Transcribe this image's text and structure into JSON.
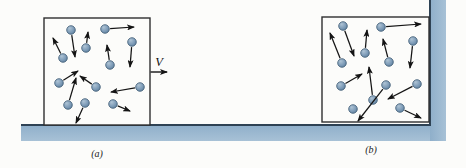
{
  "figure": {
    "description_hint": "two boxes of gas molecules with random velocity vectors; left box also moves with bulk velocity V; blue floor and right wall",
    "colors": {
      "background": "#fcfcfa",
      "wall_fill": "#8fafca",
      "wall_fill_light": "#a7c1d6",
      "wall_edge": "#2e4254",
      "box_border": "#2f2f2f",
      "particle_hi": "#aec3d4",
      "particle_fill": "#7e9cb8",
      "particle_dark": "#587a97",
      "particle_stroke": "#3d5a74",
      "arrow": "#141414",
      "label": "#222222"
    },
    "floor": {
      "x": 21,
      "y": 125,
      "w": 425,
      "h": 16
    },
    "wall": {
      "x": 430,
      "y": 0,
      "w": 16,
      "h": 141
    },
    "wall_edge_path": "M 21 125 L 430 125 L 430 0",
    "particle_radius": 4.3,
    "panels": [
      {
        "id": "a",
        "label": "(a)",
        "label_pos": {
          "x": 97,
          "y": 157
        },
        "box": {
          "x": 44,
          "y": 18,
          "w": 106,
          "h": 107
        },
        "velocity": {
          "label": "V",
          "x1": 150.5,
          "y1": 72,
          "x2": 167,
          "y2": 72,
          "label_x": 159,
          "label_y": 66
        },
        "particles": [
          [
            71,
            30,
            75,
            57
          ],
          [
            105,
            29,
            134,
            27
          ],
          [
            86,
            48,
            88,
            32
          ],
          [
            132,
            42,
            130,
            67
          ],
          [
            63,
            58,
            53,
            38
          ],
          [
            110,
            65,
            107,
            45
          ],
          [
            59,
            83,
            78,
            71
          ],
          [
            96,
            87,
            80,
            76
          ],
          [
            140,
            87,
            111,
            92
          ],
          [
            68,
            105,
            76,
            78
          ],
          [
            85,
            103,
            76,
            123
          ],
          [
            113,
            104,
            130,
            111
          ]
        ]
      },
      {
        "id": "b",
        "label": "(b)",
        "label_pos": {
          "x": 371,
          "y": 153
        },
        "velocity": null,
        "box": {
          "x": 322,
          "y": 17,
          "w": 107,
          "h": 105
        },
        "particles": [
          [
            343,
            26,
            354,
            56
          ],
          [
            381,
            27,
            421,
            24
          ],
          [
            413,
            41,
            410,
            68
          ],
          [
            365,
            53,
            367,
            30
          ],
          [
            342,
            63,
            330,
            33
          ],
          [
            389,
            62,
            383,
            39
          ],
          [
            341,
            86,
            362,
            74
          ],
          [
            386,
            85,
            358,
            121
          ],
          [
            373,
            100,
            369,
            67
          ],
          [
            417,
            84,
            388,
            99
          ],
          [
            353,
            109,
            null,
            null
          ],
          [
            400,
            108,
            421,
            118
          ]
        ]
      }
    ]
  }
}
